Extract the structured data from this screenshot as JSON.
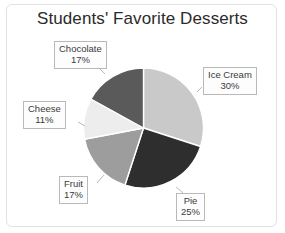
{
  "chart_data": {
    "type": "pie",
    "title": "Students' Favorite Desserts",
    "xlabel": "",
    "ylabel": "",
    "legend_position": "none",
    "grid": false,
    "labels_style": "callout-boxes-with-leader-lines",
    "value_unit": "percent",
    "categories": [
      "Ice Cream",
      "Pie",
      "Fruit",
      "Cheese",
      "Chocolate"
    ],
    "values": [
      30,
      25,
      17,
      11,
      17
    ],
    "slices": [
      {
        "label": "Ice Cream",
        "value": 30,
        "value_text": "30%",
        "color": "#c9c9c9",
        "start_angle": 0,
        "end_angle": 108
      },
      {
        "label": "Pie",
        "value": 25,
        "value_text": "25%",
        "color": "#2e2e2e",
        "start_angle": 108,
        "end_angle": 198
      },
      {
        "label": "Fruit",
        "value": 17,
        "value_text": "17%",
        "color": "#9d9d9d",
        "start_angle": 198,
        "end_angle": 259.2
      },
      {
        "label": "Cheese",
        "value": 11,
        "value_text": "11%",
        "color": "#ededed",
        "start_angle": 259.2,
        "end_angle": 298.8
      },
      {
        "label": "Chocolate",
        "value": 17,
        "value_text": "17%",
        "color": "#5a5a5a",
        "start_angle": 298.8,
        "end_angle": 360
      }
    ]
  },
  "colors": {
    "background": "#ffffff",
    "frame": "#e2e2e2",
    "title_text": "#2b2b2b",
    "callout_bg": "#fdfdfd",
    "callout_border": "#b9b9b9",
    "callout_text": "#3a3a3a",
    "slice_border": "#ffffff",
    "leader_line": "#b9b9b9"
  }
}
